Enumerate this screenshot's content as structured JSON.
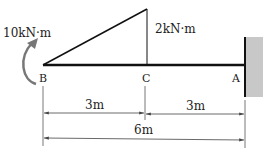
{
  "diagram": {
    "type": "cantilever-beam-moment-diagram",
    "points": {
      "B": "B",
      "C": "C",
      "A": "A"
    },
    "loads": {
      "applied_moment": "10kN·m",
      "moment_at_C": "2kN·m"
    },
    "dimensions": {
      "BC": "3m",
      "CA": "3m",
      "BA": "6m"
    },
    "colors": {
      "beam": "#111111",
      "wall_fill": "#c8c8c8",
      "moment_arrow": "#777777",
      "dimension_lines": "#444444"
    }
  }
}
